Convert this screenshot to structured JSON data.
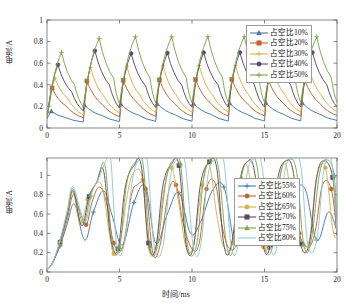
{
  "figure": {
    "background": "#ffffff",
    "panels": [
      "top",
      "bottom"
    ]
  },
  "top_panel": {
    "xlabel": "",
    "ylabel": "电流/A",
    "xticks": [
      "0",
      "5",
      "10",
      "15",
      "20"
    ],
    "yticks": [
      "0",
      "0.2",
      "0.4",
      "0.6",
      "0.8",
      "1"
    ],
    "legend": {
      "position": "upper-right",
      "items": [
        {
          "label": "占空比10%",
          "color": "#4878a8",
          "marker": "triangle"
        },
        {
          "label": "占空比20%",
          "color": "#c1632f",
          "marker": "square"
        },
        {
          "label": "占空比30%",
          "color": "#d9b04a",
          "marker": "none"
        },
        {
          "label": "占空比40%",
          "color": "#5a4a6a",
          "marker": "circle"
        },
        {
          "label": "占空比50%",
          "color": "#7ca64a",
          "marker": "plus"
        }
      ]
    }
  },
  "bottom_panel": {
    "xlabel": "时间/ms",
    "ylabel": "电流/A",
    "xticks": [
      "0",
      "5",
      "10",
      "15",
      "20"
    ],
    "yticks": [
      "0",
      "0.2",
      "0.4",
      "0.6",
      "0.8",
      "1"
    ],
    "legend": {
      "position": "center-right",
      "items": [
        {
          "label": "占空比55%",
          "color": "#4878a8",
          "marker": "plus"
        },
        {
          "label": "占空比60%",
          "color": "#c1632f",
          "marker": "circle"
        },
        {
          "label": "占空比65%",
          "color": "#d9b04a",
          "marker": "circle"
        },
        {
          "label": "占空比70%",
          "color": "#5a4a6a",
          "marker": "square"
        },
        {
          "label": "占空比75%",
          "color": "#7ca64a",
          "marker": "triangle"
        },
        {
          "label": "占空比80%",
          "color": "#8fc6dd",
          "marker": "none"
        }
      ]
    }
  },
  "chart_data": [
    {
      "type": "line",
      "panel": "top",
      "title": "",
      "xlabel": "",
      "ylabel": "电流/A",
      "xlim": [
        0,
        20
      ],
      "ylim": [
        0,
        1
      ],
      "xticks": [
        0,
        5,
        10,
        15,
        20
      ],
      "yticks": [
        0,
        0.2,
        0.4,
        0.6,
        0.8,
        1.0
      ],
      "grid": false,
      "legend_position": "upper right",
      "period_ms": 2.5,
      "description": "Sawtooth inductor-current waveforms: each period ramps up steeply then decays exponentially; peak amplitude grows with duty ratio.",
      "series": [
        {
          "name": "占空比10%",
          "color": "#4878a8",
          "marker": "triangle",
          "peaks": [
            0.155,
            0.21,
            0.225,
            0.23,
            0.235,
            0.235,
            0.235,
            0.235
          ],
          "troughs": [
            0.055,
            0.06,
            0.065,
            0.065,
            0.065,
            0.065,
            0.065,
            0.07
          ],
          "x": [
            0,
            0.3,
            1.3,
            2.5,
            2.6,
            3.8,
            5.0,
            5.1,
            6.3,
            7.5,
            7.6,
            8.8,
            10.0,
            10.1,
            11.3,
            12.5,
            12.6,
            13.8,
            15.0,
            15.1,
            16.3,
            17.5,
            17.6,
            18.8,
            20.0
          ],
          "y": [
            0.09,
            0.155,
            0.095,
            0.055,
            0.21,
            0.115,
            0.06,
            0.22,
            0.12,
            0.062,
            0.225,
            0.125,
            0.063,
            0.228,
            0.126,
            0.064,
            0.23,
            0.127,
            0.065,
            0.232,
            0.128,
            0.066,
            0.234,
            0.129,
            0.07
          ]
        },
        {
          "name": "占空比20%",
          "color": "#c1632f",
          "marker": "square",
          "peaks": [
            0.37,
            0.435,
            0.445,
            0.448,
            0.45,
            0.45,
            0.45,
            0.45
          ],
          "troughs": [
            0.095,
            0.105,
            0.11,
            0.112,
            0.112,
            0.113,
            0.113,
            0.115
          ],
          "x": [
            0,
            0.35,
            1.3,
            2.5,
            2.75,
            3.8,
            5.0,
            5.25,
            6.3,
            7.5,
            7.75,
            8.8,
            10.0,
            10.25,
            11.3,
            12.5,
            12.75,
            13.8,
            15.0,
            15.25,
            16.3,
            17.5,
            17.75,
            18.8,
            20.0
          ],
          "y": [
            0.09,
            0.37,
            0.205,
            0.095,
            0.435,
            0.22,
            0.105,
            0.443,
            0.225,
            0.108,
            0.446,
            0.227,
            0.11,
            0.448,
            0.228,
            0.111,
            0.449,
            0.229,
            0.112,
            0.45,
            0.23,
            0.113,
            0.45,
            0.23,
            0.115
          ]
        },
        {
          "name": "占空比30%",
          "color": "#d9b04a",
          "marker": "none",
          "peaks": [
            0.46,
            0.56,
            0.575,
            0.578,
            0.58,
            0.58,
            0.58,
            0.58
          ],
          "troughs": [
            0.12,
            0.14,
            0.145,
            0.147,
            0.148,
            0.148,
            0.149,
            0.15
          ],
          "x": [
            0,
            0.55,
            1.4,
            2.5,
            3.0,
            3.9,
            5.0,
            5.5,
            6.4,
            7.5,
            8.0,
            8.9,
            10.0,
            10.5,
            11.4,
            12.5,
            13.0,
            13.9,
            15.0,
            15.5,
            16.4,
            17.5,
            18.0,
            18.9,
            20.0
          ],
          "y": [
            0.09,
            0.46,
            0.28,
            0.12,
            0.56,
            0.3,
            0.14,
            0.572,
            0.305,
            0.145,
            0.576,
            0.307,
            0.147,
            0.578,
            0.308,
            0.148,
            0.579,
            0.309,
            0.148,
            0.58,
            0.31,
            0.149,
            0.58,
            0.31,
            0.15
          ]
        },
        {
          "name": "占空比40%",
          "color": "#5a4a6a",
          "marker": "circle",
          "peaks": [
            0.585,
            0.715,
            0.69,
            0.7,
            0.7,
            0.7,
            0.7,
            0.7
          ],
          "troughs": [
            0.16,
            0.185,
            0.19,
            0.192,
            0.193,
            0.193,
            0.194,
            0.195
          ],
          "x": [
            0,
            0.75,
            1.7,
            2.5,
            3.3,
            4.3,
            5.0,
            5.8,
            6.8,
            7.5,
            8.3,
            9.3,
            10.0,
            10.8,
            11.8,
            12.5,
            13.3,
            14.3,
            15.0,
            15.8,
            16.8,
            17.5,
            18.3,
            19.3,
            20.0
          ],
          "y": [
            0.09,
            0.585,
            0.335,
            0.16,
            0.715,
            0.4,
            0.185,
            0.69,
            0.39,
            0.19,
            0.695,
            0.395,
            0.192,
            0.698,
            0.4,
            0.193,
            0.7,
            0.4,
            0.193,
            0.7,
            0.4,
            0.194,
            0.7,
            0.4,
            0.195
          ]
        },
        {
          "name": "占空比50%",
          "color": "#7ca64a",
          "marker": "plus",
          "peaks": [
            0.7,
            0.83,
            0.845,
            0.845,
            0.845,
            0.845,
            0.845,
            0.845
          ],
          "troughs": [
            0.195,
            0.225,
            0.232,
            0.235,
            0.236,
            0.237,
            0.238,
            0.24
          ],
          "x": [
            0,
            1.0,
            1.9,
            2.5,
            3.6,
            4.6,
            5.0,
            6.1,
            7.1,
            7.5,
            8.6,
            9.6,
            10.0,
            11.1,
            12.1,
            12.5,
            13.6,
            14.6,
            15.0,
            16.1,
            17.1,
            17.5,
            18.6,
            19.6,
            20.0
          ],
          "y": [
            0.09,
            0.7,
            0.4,
            0.195,
            0.83,
            0.46,
            0.225,
            0.845,
            0.465,
            0.232,
            0.845,
            0.468,
            0.235,
            0.845,
            0.47,
            0.236,
            0.845,
            0.47,
            0.237,
            0.845,
            0.47,
            0.238,
            0.845,
            0.47,
            0.24
          ]
        }
      ]
    },
    {
      "type": "line",
      "panel": "bottom",
      "title": "",
      "xlabel": "时间/ms",
      "ylabel": "电流/A",
      "xlim": [
        0,
        20
      ],
      "ylim": [
        0,
        1.18
      ],
      "xticks": [
        0,
        5,
        10,
        15,
        20
      ],
      "yticks": [
        0,
        0.2,
        0.4,
        0.6,
        0.8,
        1.0
      ],
      "grid": false,
      "legend_position": "center right",
      "description": "High duty-ratio currents: startup ramp to ~0.85 then large oscillations; tops clip flat above the 1 A tick, troughs fall to ~0.2-0.5.",
      "series": [
        {
          "name": "占空比55%",
          "color": "#4878a8",
          "marker": "plus",
          "x": [
            0,
            0.4,
            0.9,
            1.4,
            1.9,
            2.6,
            3.2,
            3.9,
            4.5,
            5.2,
            6.0,
            6.8,
            7.5,
            8.3,
            9.1,
            9.9,
            10.6,
            11.4,
            12.2,
            13.0,
            13.8,
            14.6,
            15.4,
            16.2,
            17.0,
            17.8,
            18.6,
            19.4,
            20.0
          ],
          "y": [
            0.02,
            0.1,
            0.27,
            0.5,
            0.7,
            0.33,
            0.62,
            0.84,
            0.58,
            0.28,
            0.72,
            0.88,
            0.3,
            0.6,
            0.82,
            0.4,
            0.52,
            0.84,
            0.88,
            0.28,
            0.58,
            0.86,
            0.45,
            0.4,
            0.8,
            0.86,
            0.33,
            0.62,
            0.42
          ]
        },
        {
          "name": "占空比60%",
          "color": "#c1632f",
          "marker": "circle",
          "x": [
            0,
            0.4,
            0.9,
            1.4,
            1.8,
            2.2,
            2.7,
            3.1,
            3.6,
            4.1,
            4.6,
            5.2,
            5.8,
            6.2,
            6.8,
            7.3,
            7.8,
            8.4,
            8.9,
            9.4,
            10.0,
            10.5,
            11.0,
            11.6,
            12.1,
            12.6,
            13.2,
            13.7,
            14.2,
            14.8,
            15.3,
            15.8,
            16.4,
            16.9,
            17.4,
            18.0,
            18.5,
            19.0,
            19.6,
            20.0
          ],
          "y": [
            0.02,
            0.1,
            0.29,
            0.55,
            0.8,
            0.66,
            0.49,
            0.72,
            0.88,
            0.72,
            0.3,
            0.25,
            0.78,
            0.9,
            0.86,
            0.2,
            0.28,
            0.84,
            0.9,
            0.5,
            0.24,
            0.3,
            0.86,
            0.92,
            0.46,
            0.24,
            0.34,
            0.88,
            0.9,
            0.42,
            0.25,
            0.38,
            0.9,
            0.88,
            0.4,
            0.26,
            0.42,
            0.9,
            0.86,
            0.4
          ]
        },
        {
          "name": "占空比65%",
          "color": "#d9b04a",
          "marker": "circle",
          "x": [
            0,
            0.4,
            0.9,
            1.4,
            1.8,
            2.3,
            2.8,
            3.3,
            3.8,
            4.3,
            4.6,
            5.0,
            5.6,
            6.1,
            6.6,
            7.0,
            7.5,
            8.1,
            8.6,
            9.1,
            9.6,
            10.1,
            10.7,
            11.2,
            11.7,
            12.2,
            12.8,
            13.3,
            13.8,
            14.4,
            14.9,
            15.4,
            16.0,
            16.5,
            17.0,
            17.6,
            18.1,
            18.6,
            19.2,
            19.7,
            20.0
          ],
          "y": [
            0.02,
            0.1,
            0.3,
            0.58,
            0.82,
            0.5,
            0.75,
            0.9,
            0.88,
            0.4,
            0.19,
            0.26,
            0.85,
            1.05,
            0.95,
            0.25,
            0.26,
            0.88,
            1.08,
            0.7,
            0.25,
            0.28,
            0.9,
            1.1,
            0.6,
            0.26,
            0.3,
            0.92,
            1.1,
            0.55,
            0.26,
            0.32,
            0.95,
            1.1,
            0.5,
            0.27,
            0.34,
            0.98,
            1.08,
            0.45,
            0.35
          ]
        },
        {
          "name": "占空比70%",
          "color": "#5a4a6a",
          "marker": "square",
          "x": [
            0,
            0.4,
            0.9,
            1.4,
            1.8,
            2.4,
            2.9,
            3.4,
            3.9,
            4.4,
            4.9,
            5.4,
            6.0,
            6.5,
            7.0,
            7.5,
            8.0,
            8.6,
            9.1,
            9.6,
            10.1,
            10.6,
            11.2,
            11.7,
            12.2,
            12.7,
            13.3,
            13.8,
            14.3,
            14.9,
            15.4,
            15.9,
            16.5,
            17.0,
            17.5,
            18.1,
            18.6,
            19.1,
            19.7,
            20.0
          ],
          "y": [
            0.02,
            0.1,
            0.31,
            0.6,
            0.84,
            0.48,
            0.78,
            0.92,
            1.05,
            0.35,
            0.24,
            0.88,
            1.1,
            1.1,
            0.3,
            0.25,
            0.9,
            1.12,
            1.1,
            0.28,
            0.26,
            0.92,
            1.14,
            1.08,
            0.28,
            0.27,
            0.94,
            1.14,
            1.05,
            0.28,
            0.28,
            0.96,
            1.15,
            1.02,
            0.29,
            0.3,
            0.98,
            1.15,
            0.98,
            0.38
          ]
        },
        {
          "name": "占空比75%",
          "color": "#7ca64a",
          "marker": "triangle",
          "x": [
            0,
            0.4,
            0.9,
            1.4,
            1.8,
            2.5,
            3.0,
            3.5,
            4.0,
            4.5,
            5.0,
            5.5,
            6.1,
            6.6,
            7.1,
            7.6,
            8.2,
            8.7,
            9.2,
            9.7,
            10.3,
            10.8,
            11.3,
            11.8,
            12.4,
            12.9,
            13.4,
            14.0,
            14.5,
            15.0,
            15.6,
            16.1,
            16.6,
            17.2,
            17.7,
            18.2,
            18.8,
            19.3,
            19.8,
            20.0
          ],
          "y": [
            0.02,
            0.1,
            0.32,
            0.62,
            0.86,
            0.5,
            0.8,
            0.95,
            1.1,
            0.3,
            0.26,
            0.92,
            1.14,
            1.14,
            0.27,
            0.26,
            0.94,
            1.16,
            1.12,
            0.27,
            0.27,
            0.96,
            1.16,
            1.1,
            0.27,
            0.28,
            0.98,
            1.16,
            1.08,
            0.28,
            0.29,
            1.0,
            1.16,
            1.05,
            0.29,
            0.31,
            1.02,
            1.16,
            1.0,
            0.4
          ]
        },
        {
          "name": "占空比80%",
          "color": "#8fc6dd",
          "marker": "none",
          "x": [
            0,
            0.4,
            0.9,
            1.4,
            1.8,
            2.6,
            3.1,
            3.6,
            4.1,
            4.4,
            4.8,
            5.3,
            5.9,
            6.4,
            6.9,
            7.4,
            8.0,
            8.5,
            9.0,
            9.5,
            10.1,
            10.6,
            11.1,
            11.6,
            12.2,
            12.7,
            13.2,
            13.8,
            14.3,
            14.8,
            15.4,
            15.9,
            16.4,
            17.0,
            17.5,
            18.0,
            18.6,
            19.1,
            19.6,
            20.0
          ],
          "y": [
            0.02,
            0.1,
            0.33,
            0.64,
            0.88,
            0.52,
            0.82,
            0.98,
            1.16,
            1.16,
            0.28,
            0.27,
            0.96,
            1.17,
            1.16,
            0.26,
            0.27,
            0.98,
            1.17,
            1.15,
            0.26,
            0.28,
            1.0,
            1.17,
            1.14,
            0.27,
            0.29,
            1.02,
            1.17,
            1.12,
            0.27,
            0.3,
            1.04,
            1.17,
            1.1,
            0.28,
            0.33,
            1.06,
            1.17,
            0.42
          ]
        }
      ]
    }
  ]
}
